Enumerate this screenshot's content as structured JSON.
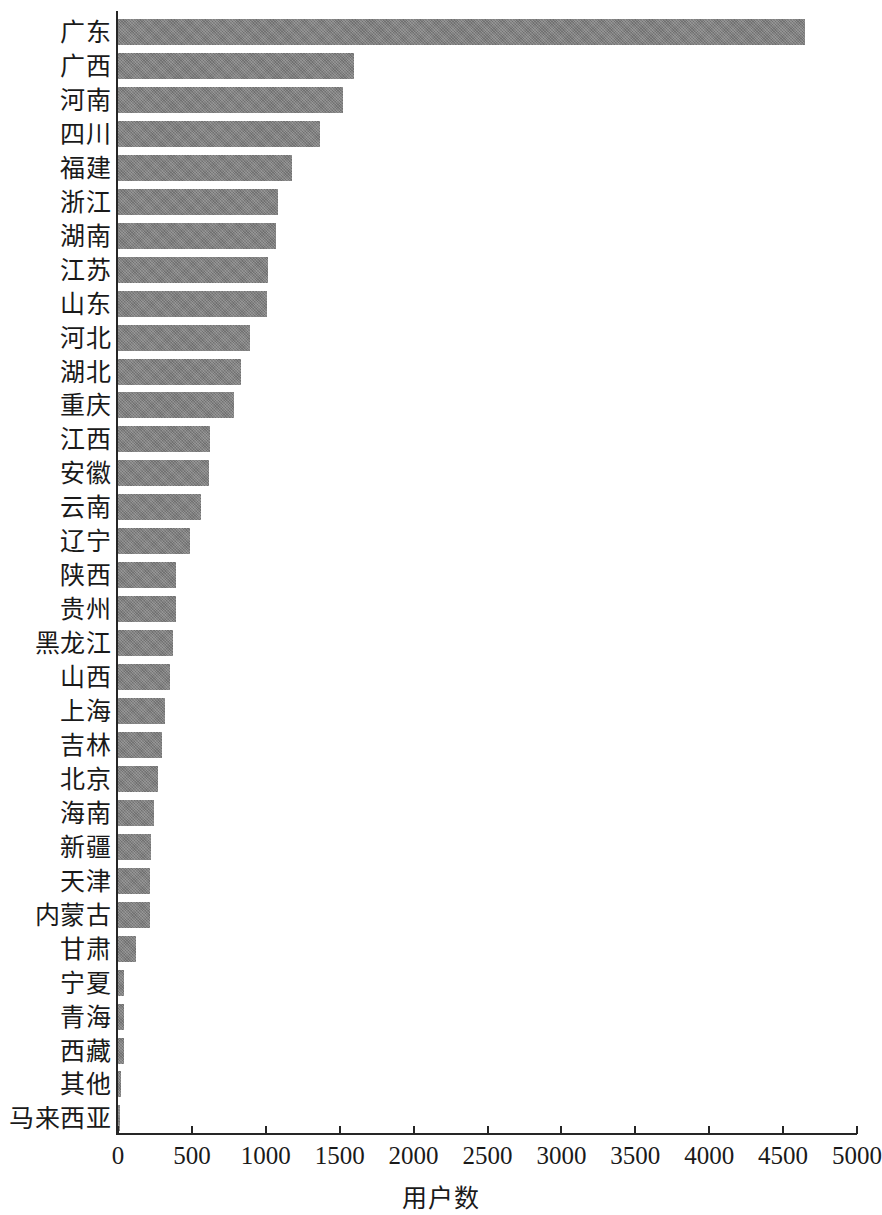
{
  "chart_data": {
    "type": "bar",
    "orientation": "horizontal",
    "title": "",
    "xlabel": "用户数",
    "ylabel": "",
    "xlim": [
      0,
      5000
    ],
    "xticks": [
      0,
      500,
      1000,
      1500,
      2000,
      2500,
      3000,
      3500,
      4000,
      4500,
      5000
    ],
    "xtick_labels": [
      "0",
      "500",
      "1000",
      "1500",
      "2000",
      "2500",
      "3000",
      "3500",
      "4000",
      "4500",
      "5000"
    ],
    "grid": false,
    "legend": null,
    "bar_color": "#808080",
    "categories": [
      "广东",
      "广西",
      "河南",
      "四川",
      "福建",
      "浙江",
      "湖南",
      "江苏",
      "山东",
      "河北",
      "湖北",
      "重庆",
      "江西",
      "安徽",
      "云南",
      "辽宁",
      "陕西",
      "贵州",
      "黑龙江",
      "山西",
      "上海",
      "吉林",
      "北京",
      "海南",
      "新疆",
      "天津",
      "内蒙古",
      "甘肃",
      "宁夏",
      "青海",
      "西藏",
      "其他",
      "马来西亚"
    ],
    "values": [
      4650,
      1600,
      1525,
      1370,
      1180,
      1085,
      1070,
      1015,
      1005,
      895,
      835,
      785,
      625,
      615,
      560,
      490,
      395,
      390,
      370,
      355,
      320,
      300,
      270,
      245,
      225,
      215,
      215,
      120,
      40,
      42,
      42,
      22,
      12
    ]
  },
  "axis": {
    "x_title": "用户数"
  }
}
